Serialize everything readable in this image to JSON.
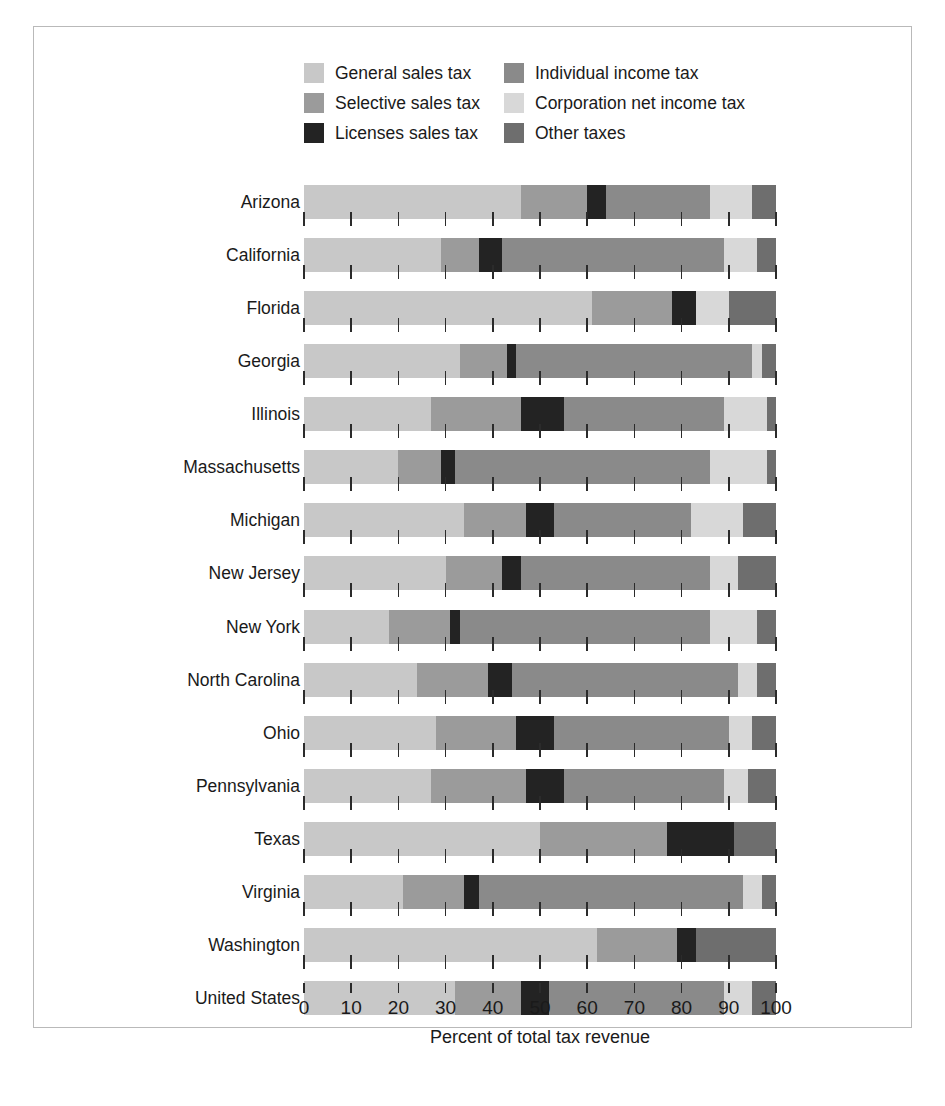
{
  "chart_data": {
    "type": "bar",
    "orientation": "horizontal",
    "stacked": true,
    "title": "",
    "xlabel": "Percent of total tax revenue",
    "ylabel": "",
    "xlim": [
      0,
      100
    ],
    "xticks": [
      0,
      10,
      20,
      30,
      40,
      50,
      60,
      70,
      80,
      90,
      100
    ],
    "xtick_labels": [
      "0",
      "10",
      "20",
      "30",
      "40",
      "50",
      "60",
      "70",
      "80",
      "90",
      "100"
    ],
    "grid": false,
    "legend_position": "top",
    "categories": [
      "Arizona",
      "California",
      "Florida",
      "Georgia",
      "Illinois",
      "Massachusetts",
      "Michigan",
      "New Jersey",
      "New York",
      "North Carolina",
      "Ohio",
      "Pennsylvania",
      "Texas",
      "Virginia",
      "Washington",
      "United States"
    ],
    "series": [
      {
        "name": "General sales tax",
        "color": "#c8c8c8",
        "values": [
          46,
          29,
          61,
          33,
          27,
          20,
          34,
          30,
          18,
          24,
          28,
          27,
          50,
          21,
          62,
          32
        ]
      },
      {
        "name": "Selective sales tax",
        "color": "#9b9b9b",
        "values": [
          14,
          8,
          17,
          10,
          19,
          9,
          13,
          12,
          13,
          15,
          17,
          20,
          27,
          13,
          17,
          14
        ]
      },
      {
        "name": "Licenses sales tax",
        "color": "#232323",
        "values": [
          4,
          5,
          5,
          2,
          9,
          3,
          6,
          4,
          2,
          5,
          8,
          8,
          14,
          3,
          4,
          6
        ]
      },
      {
        "name": "Individual income tax",
        "color": "#8a8a8a",
        "values": [
          22,
          47,
          0,
          50,
          34,
          54,
          29,
          40,
          53,
          48,
          37,
          34,
          0,
          56,
          0,
          37
        ]
      },
      {
        "name": "Corporation net income tax",
        "color": "#d8d8d8",
        "values": [
          9,
          7,
          7,
          2,
          9,
          12,
          11,
          6,
          10,
          4,
          5,
          5,
          0,
          4,
          0,
          6
        ]
      },
      {
        "name": "Other taxes",
        "color": "#6e6e6e",
        "values": [
          5,
          4,
          10,
          3,
          2,
          2,
          7,
          8,
          4,
          4,
          5,
          6,
          9,
          3,
          17,
          5
        ]
      }
    ]
  },
  "legend": {
    "entries": [
      {
        "label": "General sales tax",
        "color": "#c8c8c8"
      },
      {
        "label": "Individual income tax",
        "color": "#8a8a8a"
      },
      {
        "label": "Selective sales tax",
        "color": "#9b9b9b"
      },
      {
        "label": "Corporation net income tax",
        "color": "#d8d8d8"
      },
      {
        "label": "Licenses sales tax",
        "color": "#232323"
      },
      {
        "label": "Other taxes",
        "color": "#6e6e6e"
      }
    ]
  }
}
